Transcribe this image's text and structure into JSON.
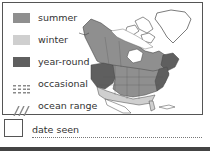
{
  "legend": {
    "items": [
      {
        "key": "summer",
        "label": "summer",
        "color": "#8f8f8f",
        "pattern": "solid"
      },
      {
        "key": "winter",
        "label": "winter",
        "color": "#cfcfcf",
        "pattern": "solid"
      },
      {
        "key": "year_round",
        "label": "year-round",
        "color": "#5f5f5f",
        "pattern": "solid"
      },
      {
        "key": "occasional",
        "label": "occasional",
        "color": "#9a9a9a",
        "pattern": "dots"
      },
      {
        "key": "ocean_range",
        "label": "ocean range",
        "color": "#9a9a9a",
        "pattern": "hatch"
      }
    ]
  },
  "map": {
    "region": "North America",
    "colors": {
      "summer": "#8f8f8f",
      "winter": "#cfcfcf",
      "year_round": "#5f5f5f",
      "land": "#ffffff",
      "outline": "#333333"
    }
  },
  "footer": {
    "date_label": "date seen"
  }
}
